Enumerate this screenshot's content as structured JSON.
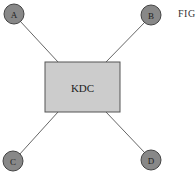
{
  "figure": {
    "label": "FIG",
    "center_node": {
      "label": "KDC",
      "fill": "#cccccc",
      "stroke": "#555555"
    },
    "nodes": [
      {
        "id": "A",
        "label": "A",
        "cx": 14,
        "cy": 14
      },
      {
        "id": "B",
        "label": "B",
        "cx": 151,
        "cy": 15
      },
      {
        "id": "C",
        "label": "C",
        "cx": 13,
        "cy": 161
      },
      {
        "id": "D",
        "label": "D",
        "cx": 151,
        "cy": 160
      }
    ],
    "node_fill": "#888888",
    "edge_color": "#555555"
  }
}
